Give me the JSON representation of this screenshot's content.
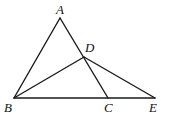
{
  "diagram": {
    "points": {
      "A": {
        "x": 60,
        "y": 18,
        "label": "A",
        "lx": 56,
        "ly": 14
      },
      "B": {
        "x": 14,
        "y": 98,
        "label": "B",
        "lx": 4,
        "ly": 112
      },
      "C": {
        "x": 108,
        "y": 98,
        "label": "C",
        "lx": 104,
        "ly": 112
      },
      "D": {
        "x": 84,
        "y": 57,
        "label": "D",
        "lx": 85,
        "ly": 52
      },
      "E": {
        "x": 155,
        "y": 98,
        "label": "E",
        "lx": 149,
        "ly": 112
      }
    },
    "segments": [
      [
        "A",
        "B"
      ],
      [
        "A",
        "C"
      ],
      [
        "B",
        "E"
      ],
      [
        "B",
        "D"
      ],
      [
        "D",
        "E"
      ]
    ]
  }
}
